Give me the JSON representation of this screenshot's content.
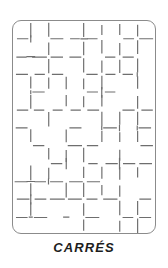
{
  "figure": {
    "kind": "textile-pattern-swatch",
    "caption": "CARRÉS",
    "background_color": "#ffffff"
  },
  "frame": {
    "x": 12,
    "y": 20,
    "width": 144,
    "height": 214,
    "corner_radius": 9,
    "stroke_color": "#8b8b8b",
    "stroke_width": 1,
    "fill_color": "#ffffff"
  },
  "pattern": {
    "name": "carres",
    "description": "grid of squares drawn with broken dashed strokes",
    "cell_size": 18,
    "columns": 8,
    "rows": 12,
    "line_color": "#6e6e6e",
    "line_width": 1.2,
    "dash_style": "broken",
    "vertical_line_offsets": [
      18,
      36,
      54,
      72,
      90,
      108,
      126
    ],
    "horizontal_line_offsets": [
      18,
      36,
      54,
      72,
      90,
      108,
      126,
      144,
      162,
      180,
      198
    ],
    "segments": {
      "vertical": [
        [
          0,
          0.0,
          0.62
        ],
        [
          0,
          0.74,
          1.0
        ],
        [
          1,
          0.1,
          0.55
        ],
        [
          1,
          0.68,
          0.95
        ],
        [
          2,
          0.0,
          0.46
        ],
        [
          2,
          0.6,
          1.0
        ],
        [
          3,
          0.16,
          0.7
        ],
        [
          3,
          0.82,
          1.0
        ],
        [
          4,
          0.0,
          0.34
        ],
        [
          4,
          0.48,
          0.9
        ],
        [
          5,
          0.08,
          0.58
        ],
        [
          5,
          0.72,
          1.0
        ],
        [
          6,
          0.0,
          0.52
        ],
        [
          6,
          0.66,
          0.96
        ],
        [
          7,
          0.12,
          0.64
        ],
        [
          7,
          0.78,
          1.0
        ],
        [
          8,
          0.0,
          0.44
        ],
        [
          8,
          0.56,
          0.88
        ],
        [
          9,
          0.14,
          0.6
        ],
        [
          9,
          0.76,
          1.0
        ],
        [
          10,
          0.0,
          0.5
        ],
        [
          10,
          0.64,
          0.94
        ],
        [
          11,
          0.06,
          0.56
        ],
        [
          11,
          0.7,
          1.0
        ]
      ],
      "horizontal": [
        [
          0,
          0.0,
          0.58
        ],
        [
          0,
          0.7,
          1.0
        ],
        [
          1,
          0.08,
          0.5
        ],
        [
          1,
          0.64,
          0.96
        ],
        [
          2,
          0.0,
          0.42
        ],
        [
          2,
          0.56,
          1.0
        ],
        [
          3,
          0.14,
          0.66
        ],
        [
          3,
          0.8,
          1.0
        ],
        [
          4,
          0.0,
          0.38
        ],
        [
          4,
          0.52,
          0.92
        ],
        [
          5,
          0.1,
          0.6
        ],
        [
          5,
          0.74,
          1.0
        ],
        [
          6,
          0.0,
          0.48
        ],
        [
          6,
          0.62,
          0.98
        ],
        [
          7,
          0.16,
          0.68
        ],
        [
          7,
          0.82,
          1.0
        ]
      ]
    }
  }
}
